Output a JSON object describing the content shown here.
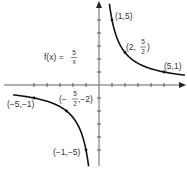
{
  "chart_data": {
    "type": "line",
    "title": "",
    "function_label": {
      "lhs": "f(x) =",
      "num": "5",
      "den": "x"
    },
    "xlabel": "",
    "ylabel": "",
    "xlim": [
      -6.5,
      6.5
    ],
    "ylim": [
      -6.5,
      6.5
    ],
    "x_ticks": [
      -5,
      -4,
      -3,
      -2,
      -1,
      1,
      2,
      3,
      4,
      5
    ],
    "y_ticks": [
      -5,
      -4,
      -3,
      -2,
      -1,
      1,
      2,
      3,
      4,
      5
    ],
    "grid": false,
    "series": [
      {
        "name": "f(x)=5/x, x>0",
        "x": [
          0.9,
          1,
          2,
          2.5,
          5,
          6.5
        ],
        "y": [
          5.56,
          5,
          2.5,
          2,
          1,
          0.77
        ]
      },
      {
        "name": "f(x)=5/x, x<0",
        "x": [
          -6.5,
          -5,
          -2.5,
          -2,
          -1,
          -0.9
        ],
        "y": [
          -0.77,
          -1,
          -2,
          -2.5,
          -5,
          -5.56
        ]
      }
    ],
    "annotations": [
      {
        "text": "(1,5)",
        "x": 1,
        "y": 5
      },
      {
        "text": "(2,5/2)",
        "x": 2,
        "y": 2.5
      },
      {
        "text": "(5,1)",
        "x": 5,
        "y": 1
      },
      {
        "text": "(-5,-1)",
        "x": -5,
        "y": -1
      },
      {
        "text": "(-5/2,-2)",
        "x": -2.5,
        "y": -2
      },
      {
        "text": "(-1,-5)",
        "x": -1,
        "y": -5
      }
    ]
  },
  "labels": {
    "fx_lhs": "f(x) =",
    "fx_num": "5",
    "fx_den": "x",
    "p1": "(1,5)",
    "p2_a": "(2,",
    "p2_num": "5",
    "p2_den": "2",
    "p2_b": ")",
    "p3": "(5,1)",
    "p4": "(−5,−1)",
    "p5_a": "(−",
    "p5_num": "5",
    "p5_den": "2",
    "p5_b": ",−2)",
    "p6": "(−1,−5)"
  }
}
